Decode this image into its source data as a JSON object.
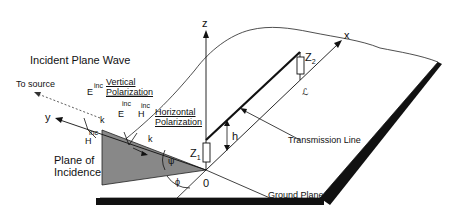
{
  "diagram": {
    "title": "Incident Plane Wave",
    "labels": {
      "to_source": "To source",
      "vertical_polarization_line1": "Vertical",
      "vertical_polarization_line2": "Polarization",
      "horizontal_polarization_line1": "Horizontal",
      "horizontal_polarization_line2": "Polarization",
      "plane_of_incidence_line1": "Plane of",
      "plane_of_incidence_line2": "Incidence",
      "transmission_line": "Transmission Line",
      "ground_plane": "Ground Plane",
      "origin": "0",
      "axis_x": "x",
      "axis_y": "y",
      "axis_z": "z",
      "z1": "Z",
      "z1_sub": "1",
      "z2": "Z",
      "z2_sub": "2",
      "h": "h",
      "length": "ℒ",
      "psi": "ψ",
      "phi": "ϕ",
      "E": "E",
      "H": "H",
      "k": "k",
      "k_hat": "^",
      "inc": "inc"
    }
  }
}
